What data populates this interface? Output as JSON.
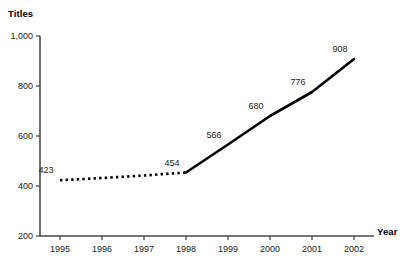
{
  "chart_data": {
    "type": "line",
    "title": "",
    "xlabel": "Year",
    "ylabel": "Titles",
    "categories": [
      "1995",
      "1996",
      "1997",
      "1998",
      "1999",
      "2000",
      "2001",
      "2002"
    ],
    "x": [
      1995,
      1996,
      1997,
      1998,
      1999,
      2000,
      2001,
      2002
    ],
    "values": [
      423,
      432,
      442,
      454,
      566,
      680,
      776,
      908
    ],
    "point_labels": [
      "423",
      "",
      "",
      "454",
      "566",
      "680",
      "776",
      "908"
    ],
    "series": [
      {
        "name": "Titles",
        "style": "dotted",
        "segment": "estimated",
        "x": [
          1995,
          1996,
          1997,
          1998
        ],
        "values": [
          423,
          432,
          442,
          454
        ]
      },
      {
        "name": "Titles",
        "style": "solid",
        "segment": "actual",
        "x": [
          1998,
          1999,
          2000,
          2001,
          2002
        ],
        "values": [
          454,
          566,
          680,
          776,
          908
        ]
      }
    ],
    "ylim": [
      200,
      1000
    ],
    "y_ticks": [
      200,
      400,
      600,
      800,
      1000
    ],
    "y_tick_labels": [
      "200",
      "400",
      "600",
      "800",
      "1,000"
    ],
    "xlim": [
      1995,
      2002
    ],
    "grid": false,
    "legend": "none",
    "line_color": "#000000",
    "axis_color": "#4a4a4a",
    "text_color": "#1a1a1a",
    "background": "#ffffff"
  },
  "axes": {
    "y_title": "Titles",
    "x_title": "Year"
  }
}
